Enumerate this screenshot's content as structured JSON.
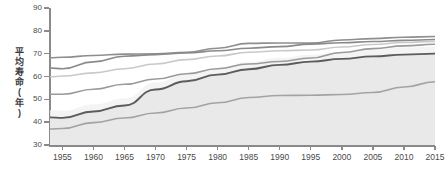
{
  "chart_data": {
    "type": "line",
    "title": "",
    "xlabel": "",
    "ylabel": "平均寿命(年)",
    "xlim": [
      1953,
      2015
    ],
    "ylim": [
      30,
      90
    ],
    "ytick_labels": [
      "30",
      "40",
      "50",
      "60",
      "70",
      "80",
      "90"
    ],
    "ytick_values": [
      30,
      40,
      50,
      60,
      70,
      80,
      90
    ],
    "xtick_labels": [
      "1955",
      "1960",
      "1965",
      "1970",
      "1975",
      "1980",
      "1985",
      "1990",
      "1995",
      "2000",
      "2005",
      "2010",
      "2015"
    ],
    "xtick_values": [
      1955,
      1960,
      1965,
      1970,
      1975,
      1980,
      1985,
      1990,
      1995,
      2000,
      2005,
      2010,
      2015
    ],
    "grid": false,
    "legend": "none",
    "x": [
      1953,
      1955,
      1960,
      1965,
      1970,
      1975,
      1980,
      1985,
      1990,
      1995,
      2000,
      2005,
      2010,
      2015
    ],
    "series": [
      {
        "name": "series-1",
        "color": "#8e8e8e",
        "width": 1.6,
        "values": [
          68.2,
          68.4,
          69.2,
          69.8,
          69.9,
          70.6,
          72.4,
          74.5,
          74.7,
          74.6,
          76.0,
          76.6,
          77.2,
          77.5
        ]
      },
      {
        "name": "series-2",
        "color": "#8a8a8a",
        "width": 1.6,
        "values": [
          63.7,
          63.4,
          66.4,
          68.9,
          69.6,
          70.3,
          71.3,
          72.4,
          73.1,
          74.2,
          74.8,
          75.3,
          75.8,
          76.2
        ]
      },
      {
        "name": "series-3",
        "color": "#c9c9c9",
        "width": 1.6,
        "values": [
          59.8,
          60.2,
          61.6,
          63.4,
          65.5,
          67.4,
          69.0,
          70.6,
          71.3,
          71.6,
          72.9,
          74.0,
          74.9,
          75.4
        ]
      },
      {
        "name": "series-4",
        "color": "#9a9a9a",
        "width": 1.6,
        "values": [
          52.2,
          52.2,
          54.4,
          56.6,
          58.9,
          61.2,
          63.4,
          65.5,
          66.6,
          68.1,
          70.5,
          72.2,
          73.4,
          74.1
        ]
      },
      {
        "name": "series-5",
        "color": "#5c5c5c",
        "width": 1.9,
        "values": [
          42.1,
          41.9,
          44.7,
          47.3,
          54.3,
          57.9,
          60.8,
          63.2,
          65.1,
          66.5,
          67.7,
          68.8,
          69.6,
          70.0
        ]
      },
      {
        "name": "series-6",
        "color": "#a3a3a3",
        "width": 1.6,
        "values": [
          37.0,
          37.2,
          39.8,
          41.8,
          44.0,
          46.2,
          48.5,
          50.8,
          51.7,
          51.8,
          52.1,
          53.0,
          55.4,
          57.7
        ]
      }
    ],
    "shaded_area": {
      "name": "shaded-band-under-series-5",
      "color": "#e9e9e9",
      "from_series": "series-5",
      "to": 30
    },
    "band_highlight": {
      "name": "light-band-above-series-5",
      "color": "#f2f2f2"
    },
    "axis_color": "#8a8a8a",
    "tick_text_color": "#4a4a4a",
    "background": "#ffffff"
  }
}
